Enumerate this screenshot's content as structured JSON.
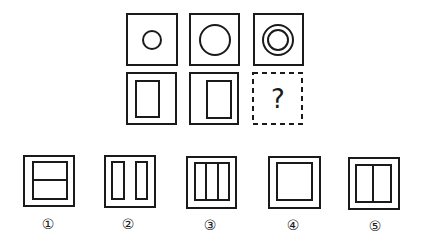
{
  "puzzle": {
    "question_mark": "?",
    "grid": [
      {
        "id": "cell-1",
        "outer": "square",
        "inner": "small-circle"
      },
      {
        "id": "cell-2",
        "outer": "square",
        "inner": "large-circle"
      },
      {
        "id": "cell-3",
        "outer": "square",
        "inner": "concentric-circles"
      },
      {
        "id": "cell-4",
        "outer": "square",
        "inner": "rectangle-left"
      },
      {
        "id": "cell-5",
        "outer": "square",
        "inner": "rectangle-right"
      },
      {
        "id": "cell-6",
        "outer": "dashed-square",
        "inner": "question-mark"
      }
    ]
  },
  "options": [
    {
      "label": "①",
      "figure": "square-with-rectangle-split-horizontally"
    },
    {
      "label": "②",
      "figure": "square-with-two-vertical-rectangles"
    },
    {
      "label": "③",
      "figure": "square-with-rectangle-split-into-three-columns"
    },
    {
      "label": "④",
      "figure": "square-with-inner-square"
    },
    {
      "label": "⑤",
      "figure": "square-with-rectangle-split-vertically"
    }
  ]
}
